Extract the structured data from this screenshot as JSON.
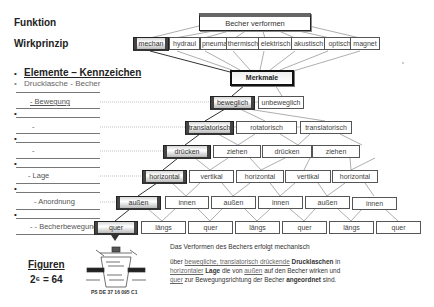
{
  "labels": {
    "funktion": "Funktion",
    "wirkprinzip": "Wirkprinzip",
    "elemente": "Elemente – Kennzeichen",
    "drucklasche": "Drucklasche - Becher",
    "bewegung": "- Bewegung",
    "dash1": "-",
    "dash2": "-",
    "lage": "- Lage",
    "anordnung": "- Anordnung",
    "becherbewegung": "- - Becherbewegung",
    "figuren": "Figuren",
    "formula": "2⁶ = 64",
    "patent": "PS DE 37 16 095 C1"
  },
  "diagram": {
    "function": "Becher verformen",
    "principles": [
      "mechan",
      "hydraul",
      "pneumat",
      "thermisch",
      "elektrisch",
      "akustisch",
      "optisch",
      "magnet"
    ],
    "selected_principle": "mechan",
    "merkmale": "Merkmale",
    "levels": [
      {
        "name": "Bewegung",
        "options": [
          "beweglich",
          "unbeweglich"
        ],
        "selected": 0
      },
      {
        "name": "Bewegungsart",
        "options": [
          "translatorisch",
          "rotatorisch",
          "translatorisch"
        ],
        "selected": 0
      },
      {
        "name": "Richtung",
        "options": [
          "drücken",
          "ziehen",
          "drücken",
          "ziehen"
        ],
        "selected": 0
      },
      {
        "name": "Lage",
        "options": [
          "horizontal",
          "vertikal",
          "horizontal",
          "vertikal",
          "horizontal"
        ],
        "selected": 0
      },
      {
        "name": "Anordnung",
        "options": [
          "außen",
          "innen",
          "außen",
          "innen",
          "außen",
          "innen"
        ],
        "selected": 0
      },
      {
        "name": "Becherbewegung",
        "options": [
          "quer",
          "längs",
          "quer",
          "längs",
          "quer",
          "längs",
          "quer"
        ],
        "selected": 0
      }
    ]
  },
  "description": {
    "line1": "Das Verformen des Bechers erfolgt mechanisch",
    "p_uber": "über ",
    "p_beweglich": "bewegliche, translatorisch drückende",
    "p_drucklaschen": " Drucklaschen",
    "p_in": " in",
    "p_horizontaler": "horizontaler",
    "p_lage": " Lage",
    "p_dievon": " die von ",
    "p_aussen": "außen",
    "p_auf": " auf den Becher wirken und",
    "p_quer": "quer",
    "p_zur": " zur Bewegungsrichtung der Becher ",
    "p_angeordnet": "angeordnet",
    "p_sind": " sind."
  }
}
